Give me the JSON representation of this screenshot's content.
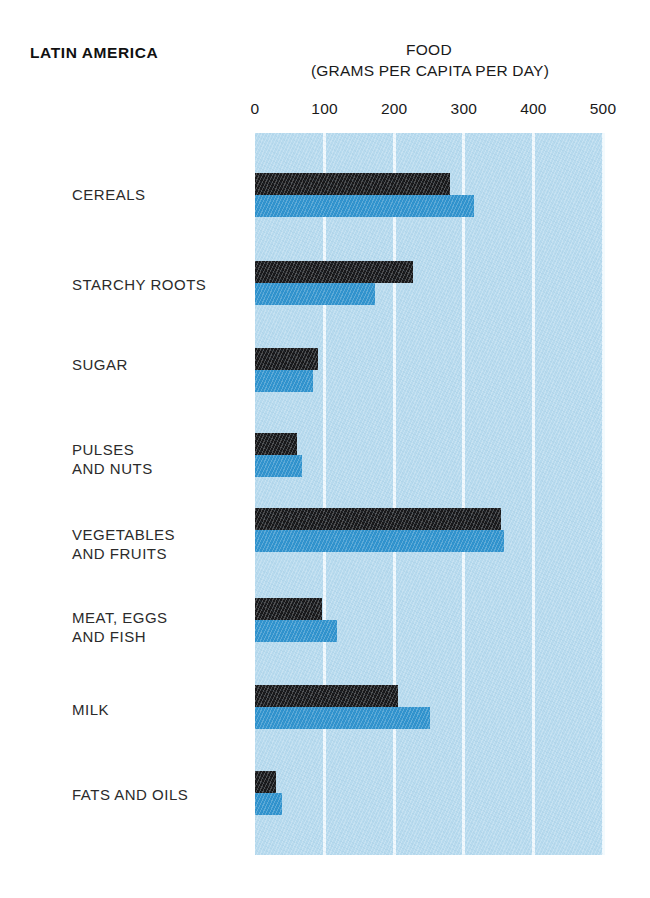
{
  "region_title": "LATIN AMERICA",
  "chart_title": "FOOD",
  "chart_subtitle": "(GRAMS PER CAPITA PER DAY)",
  "colors": {
    "plot_background": "#b7daee",
    "gridline": "#f2fafd",
    "series_dark": "#18181a",
    "series_light": "#2f92cd",
    "text": "#1a1a1a"
  },
  "chart_data": {
    "type": "bar",
    "orientation": "horizontal",
    "title": "FOOD",
    "subtitle": "(GRAMS PER CAPITA PER DAY)",
    "region": "LATIN AMERICA",
    "xlabel": "(GRAMS PER CAPITA PER DAY)",
    "ylabel": "",
    "xlim": [
      0,
      500
    ],
    "xticks": [
      0,
      100,
      200,
      300,
      400,
      500
    ],
    "xticklabels": [
      "0",
      "100",
      "200",
      "300",
      "400",
      "500"
    ],
    "grid": true,
    "grid_axis": "x",
    "legend": false,
    "legend_position": "none",
    "categories": [
      "CEREALS",
      "STARCHY ROOTS",
      "SUGAR",
      "PULSES\nAND NUTS",
      "VEGETABLES\nAND FRUITS",
      "MEAT, EGGS\nAND FISH",
      "MILK",
      "FATS AND OILS"
    ],
    "series": [
      {
        "name": "dark",
        "color": "#18181a",
        "values": [
          280,
          227,
          91,
          60,
          353,
          96,
          205,
          30
        ]
      },
      {
        "name": "light",
        "color": "#2f92cd",
        "values": [
          315,
          172,
          83,
          67,
          358,
          118,
          251,
          39
        ]
      }
    ]
  },
  "layout": {
    "plot": {
      "left": 255,
      "top": 133,
      "width": 348,
      "height": 722
    },
    "group_tops": [
      40,
      128,
      215,
      300,
      375,
      465,
      552,
      638
    ],
    "bar_height": 22,
    "label_tops": [
      185,
      275,
      355,
      440,
      525,
      608,
      700,
      785
    ],
    "label_left": 72
  }
}
